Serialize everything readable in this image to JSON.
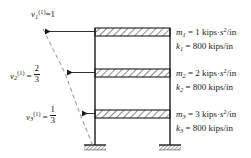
{
  "figure": {
    "type": "three-story-shear-frame-mode-shape",
    "mode_index": "(1)",
    "colors": {
      "line": "#1a1a1a",
      "dashed": "#8a8a8a",
      "background": "#ffffff",
      "hatch": "#1a1a1a"
    }
  },
  "mode_shape": {
    "label_prefix": "v",
    "mode_superscript": "(1)",
    "entries": [
      {
        "symbol": "v",
        "subscript": "1",
        "superscript": "(1)",
        "equals": "=",
        "value": "1",
        "value_kind": "integer",
        "numerator": "",
        "denominator": "",
        "floor": "roof"
      },
      {
        "symbol": "v",
        "subscript": "2",
        "superscript": "(1)",
        "equals": "=",
        "value": "2/3",
        "value_kind": "fraction",
        "numerator": "2",
        "denominator": "3",
        "floor": "second"
      },
      {
        "symbol": "v",
        "subscript": "3",
        "superscript": "(1)",
        "equals": "=",
        "value": "1/3",
        "value_kind": "fraction",
        "numerator": "1",
        "denominator": "3",
        "floor": "first"
      }
    ]
  },
  "properties": {
    "rows": [
      {
        "symbol": "m",
        "subscript": "1",
        "equals": "=",
        "number": "1",
        "unit_main": "kips",
        "unit_sep": "·",
        "unit_time": "s",
        "unit_time_exp": "2",
        "unit_denom": "/in",
        "kind": "mass",
        "full_text": "m1 = 1 kips·s2/in"
      },
      {
        "symbol": "k",
        "subscript": "1",
        "equals": "=",
        "number": "800",
        "unit_main": "kips/in",
        "unit_sep": "",
        "unit_time": "",
        "unit_time_exp": "",
        "unit_denom": "",
        "kind": "stiffness",
        "full_text": "k1 = 800 kips/in"
      },
      {
        "symbol": "m",
        "subscript": "2",
        "equals": "=",
        "number": "2",
        "unit_main": "kips",
        "unit_sep": "·",
        "unit_time": "s",
        "unit_time_exp": "2",
        "unit_denom": "/in",
        "kind": "mass",
        "full_text": "m2 = 2 kips·s2/in"
      },
      {
        "symbol": "k",
        "subscript": "2",
        "equals": "=",
        "number": "800",
        "unit_main": "kips/in",
        "unit_sep": "",
        "unit_time": "",
        "unit_time_exp": "",
        "unit_denom": "",
        "kind": "stiffness",
        "full_text": "k2 = 800 kips/in"
      },
      {
        "symbol": "m",
        "subscript": "3",
        "equals": "=",
        "number": "3",
        "unit_main": "kips",
        "unit_sep": "·",
        "unit_time": "s",
        "unit_time_exp": "2",
        "unit_denom": "/in",
        "kind": "mass",
        "full_text": "m3 = 3 kips·s2/in"
      },
      {
        "symbol": "k",
        "subscript": "3",
        "equals": "=",
        "number": "800",
        "unit_main": "kips/in",
        "unit_sep": "",
        "unit_time": "",
        "unit_time_exp": "",
        "unit_denom": "",
        "kind": "stiffness",
        "full_text": "k3 = 800 kips/in"
      }
    ]
  },
  "frame": {
    "stories": 3,
    "left_column_x": 95,
    "right_column_x": 170,
    "slab_levels": [
      {
        "name": "roof-slab",
        "y": 28
      },
      {
        "name": "second-floor-slab",
        "y": 69
      },
      {
        "name": "first-floor-slab",
        "y": 110
      }
    ],
    "base_y": 145,
    "support_type": "fixed"
  }
}
